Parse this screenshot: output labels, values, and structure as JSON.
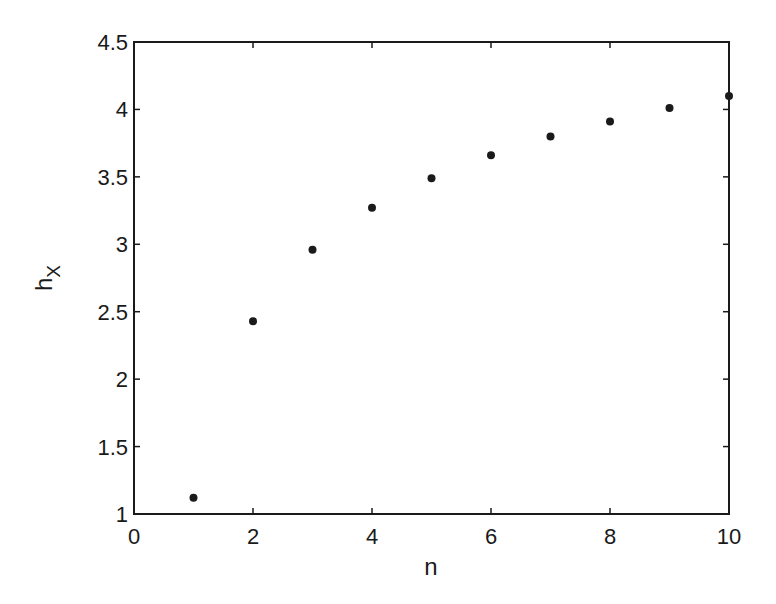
{
  "chart_data": {
    "type": "scatter",
    "title": "",
    "xlabel": "n",
    "ylabel": "h",
    "ylabel_subscript": "X",
    "xlim": [
      0,
      10
    ],
    "ylim": [
      1,
      4.5
    ],
    "xticks": [
      0,
      2,
      4,
      6,
      8,
      10
    ],
    "yticks": [
      1,
      1.5,
      2,
      2.5,
      3,
      3.5,
      4,
      4.5
    ],
    "xtick_labels": [
      "0",
      "2",
      "4",
      "6",
      "8",
      "10"
    ],
    "ytick_labels": [
      "1",
      "1.5",
      "2",
      "2.5",
      "3",
      "3.5",
      "4",
      "4.5"
    ],
    "grid": false,
    "legend": null,
    "series": [
      {
        "name": "h_X",
        "marker": "dot",
        "color": "#1a1a1a",
        "x": [
          1,
          2,
          3,
          4,
          5,
          6,
          7,
          8,
          9,
          10
        ],
        "y": [
          1.12,
          2.43,
          2.96,
          3.27,
          3.49,
          3.66,
          3.8,
          3.91,
          4.01,
          4.1
        ]
      }
    ]
  }
}
